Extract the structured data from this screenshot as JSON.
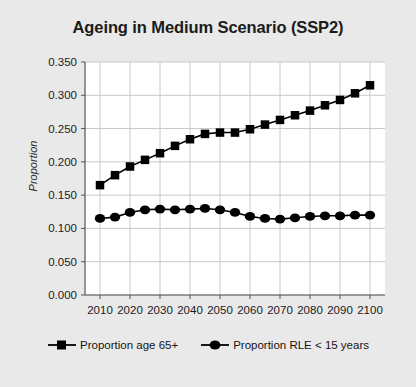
{
  "chart_data": {
    "type": "line",
    "title": "Ageing in Medium Scenario (SSP2)",
    "xlabel": "",
    "ylabel": "Proportion",
    "xlim": [
      2005,
      2105
    ],
    "ylim": [
      0.0,
      0.35
    ],
    "grid": true,
    "legend_position": "bottom",
    "x": [
      2010,
      2015,
      2020,
      2025,
      2030,
      2035,
      2040,
      2045,
      2050,
      2055,
      2060,
      2065,
      2070,
      2075,
      2080,
      2085,
      2090,
      2095,
      2100
    ],
    "xticks": [
      2010,
      2020,
      2030,
      2040,
      2050,
      2060,
      2070,
      2080,
      2090,
      2100
    ],
    "xtick_labels": [
      "2010",
      "2020",
      "2030",
      "2040",
      "2050",
      "2060",
      "2070",
      "2080",
      "2090",
      "2100"
    ],
    "yticks": [
      0.0,
      0.05,
      0.1,
      0.15,
      0.2,
      0.25,
      0.3,
      0.35
    ],
    "ytick_labels": [
      "0.000",
      "0.050",
      "0.100",
      "0.150",
      "0.200",
      "0.250",
      "0.300",
      "0.350"
    ],
    "series": [
      {
        "name": "Proportion age 65+",
        "marker": "square",
        "color": "#000000",
        "values": [
          0.165,
          0.18,
          0.193,
          0.203,
          0.213,
          0.224,
          0.234,
          0.242,
          0.244,
          0.244,
          0.249,
          0.256,
          0.263,
          0.27,
          0.277,
          0.285,
          0.293,
          0.303,
          0.315
        ]
      },
      {
        "name": "Proportion RLE < 15 years",
        "marker": "circle",
        "color": "#000000",
        "values": [
          0.115,
          0.117,
          0.124,
          0.128,
          0.129,
          0.128,
          0.129,
          0.13,
          0.128,
          0.124,
          0.118,
          0.115,
          0.114,
          0.116,
          0.118,
          0.119,
          0.119,
          0.12,
          0.12
        ]
      }
    ]
  },
  "legend": {
    "items": [
      {
        "label": "Proportion age 65+",
        "marker": "square"
      },
      {
        "label": "Proportion RLE < 15 years",
        "marker": "circle"
      }
    ]
  },
  "colors": {
    "background": "#e9e9e9",
    "plot_background": "#ffffff",
    "series": "#000000",
    "grid": "#c8c8c8",
    "axis": "#555555"
  }
}
